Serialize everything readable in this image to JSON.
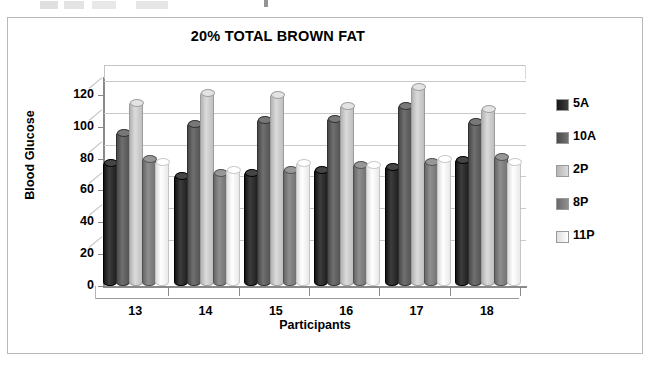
{
  "page": {
    "faint_top_text": "",
    "frame": "document-scan-frame"
  },
  "chart_data": {
    "type": "bar",
    "title": "20% TOTAL BROWN FAT",
    "xlabel": "Participants",
    "ylabel": "Blood Glucose",
    "categories": [
      "13",
      "14",
      "15",
      "16",
      "17",
      "18"
    ],
    "ylim": [
      0,
      130
    ],
    "yticks": [
      0,
      20,
      40,
      60,
      80,
      100,
      120
    ],
    "grid": true,
    "legend_position": "right",
    "series": [
      {
        "name": "5A",
        "color": "#2b2b2b",
        "values": [
          77,
          69,
          71,
          73,
          75,
          79
        ]
      },
      {
        "name": "10A",
        "color": "#5e5e5e",
        "values": [
          96,
          102,
          104,
          105,
          113,
          103
        ]
      },
      {
        "name": "2P",
        "color": "#c9c9c9",
        "values": [
          115,
          121,
          120,
          113,
          125,
          111
        ]
      },
      {
        "name": "8P",
        "color": "#7d7d7d",
        "values": [
          80,
          71,
          73,
          76,
          78,
          81
        ]
      },
      {
        "name": "11P",
        "color": "#f2f2f2",
        "values": [
          78,
          73,
          77,
          76,
          80,
          78
        ]
      }
    ]
  },
  "legend": {
    "items": [
      {
        "label": "5A",
        "color": "#2b2b2b"
      },
      {
        "label": "10A",
        "color": "#5e5e5e"
      },
      {
        "label": "2P",
        "color": "#c9c9c9"
      },
      {
        "label": "8P",
        "color": "#7d7d7d"
      },
      {
        "label": "11P",
        "color": "#f2f2f2"
      }
    ]
  },
  "yticks": {
    "t0": "0",
    "t1": "20",
    "t2": "40",
    "t3": "60",
    "t4": "80",
    "t5": "100",
    "t6": "120"
  }
}
